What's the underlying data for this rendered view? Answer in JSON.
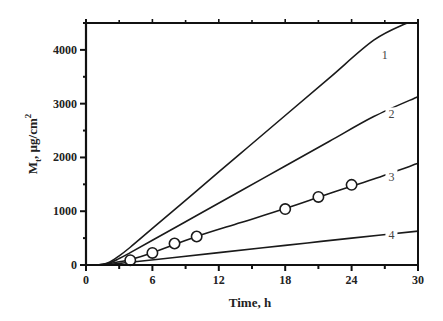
{
  "chart_data": {
    "type": "line",
    "title": "",
    "xlabel": "Time, h",
    "ylabel": "M_t, µg/cm²",
    "ylabel_parts": {
      "main": "M",
      "sub": "t",
      "rest": ", µg/cm",
      "sup": "2"
    },
    "xlim": [
      0,
      30
    ],
    "ylim": [
      0,
      4500
    ],
    "x_ticks": [
      0,
      6,
      12,
      18,
      24,
      30
    ],
    "x_minor_step": 3,
    "y_ticks": [
      0,
      1000,
      2000,
      3000,
      4000
    ],
    "y_minor_step": 500,
    "grid": false,
    "legend": "inline curve labels",
    "series": [
      {
        "name": "1",
        "label_at": {
          "x": 27,
          "y": 3900
        },
        "x": [
          0,
          1,
          2,
          3,
          4,
          6,
          10,
          14,
          18,
          22,
          26,
          29
        ],
        "y": [
          0,
          0,
          40,
          170,
          330,
          680,
          1380,
          2080,
          2780,
          3480,
          4180,
          4500
        ]
      },
      {
        "name": "2",
        "label_at": {
          "x": 27.6,
          "y": 2800
        },
        "x": [
          0,
          1,
          2,
          3,
          4,
          6,
          10,
          14,
          18,
          22,
          26,
          30
        ],
        "y": [
          0,
          0,
          30,
          120,
          230,
          460,
          920,
          1380,
          1840,
          2300,
          2760,
          3130
        ]
      },
      {
        "name": "3",
        "label_at": {
          "x": 27.6,
          "y": 1640
        },
        "x": [
          0,
          1,
          2,
          3,
          4,
          6,
          10,
          14,
          18,
          22,
          26,
          30
        ],
        "y": [
          0,
          0,
          20,
          60,
          100,
          230,
          530,
          790,
          1050,
          1330,
          1600,
          1890
        ]
      },
      {
        "name": "4",
        "label_at": {
          "x": 27.6,
          "y": 560
        },
        "x": [
          0,
          1,
          2,
          3,
          4,
          8,
          12,
          16,
          20,
          24,
          30
        ],
        "y": [
          0,
          0,
          10,
          30,
          50,
          140,
          230,
          320,
          410,
          500,
          630
        ]
      }
    ],
    "markers": {
      "series": "3",
      "style": "open circle",
      "points": [
        {
          "x": 4,
          "y": 90
        },
        {
          "x": 6,
          "y": 225
        },
        {
          "x": 8,
          "y": 400
        },
        {
          "x": 10,
          "y": 530
        },
        {
          "x": 18,
          "y": 1040
        },
        {
          "x": 21,
          "y": 1265
        },
        {
          "x": 24,
          "y": 1490
        }
      ]
    }
  },
  "colors": {
    "line": "#1a1a1a",
    "axis": "#111111",
    "background": "#ffffff"
  }
}
